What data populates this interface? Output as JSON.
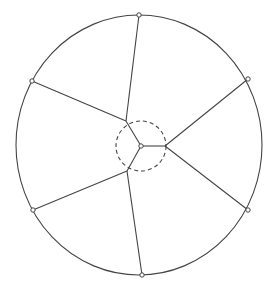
{
  "diagram": {
    "type": "geometric-construction",
    "outer_circle": {
      "style": "solid"
    },
    "inner_circle": {
      "style": "dashed"
    },
    "center_point": "P",
    "boundary_points": [
      "T",
      "LT",
      "RT",
      "LB",
      "RB",
      "B"
    ],
    "junctions": [
      "A",
      "Bj",
      "C"
    ],
    "edges": [
      [
        "P",
        "A"
      ],
      [
        "P",
        "Bj"
      ],
      [
        "P",
        "C"
      ],
      [
        "A",
        "T"
      ],
      [
        "A",
        "LT"
      ],
      [
        "Bj",
        "RT"
      ],
      [
        "Bj",
        "RB"
      ],
      [
        "C",
        "LB"
      ],
      [
        "C",
        "B"
      ]
    ],
    "colors": {
      "stroke": "#444444",
      "background": "#ffffff"
    }
  }
}
